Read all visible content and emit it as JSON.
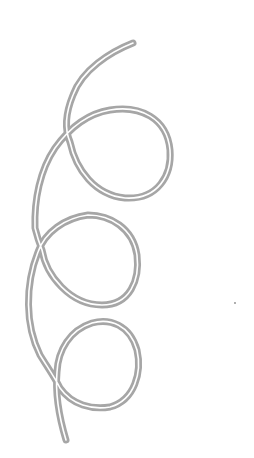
{
  "image": {
    "subject": "line drawing of a looping coiled ribbon with three loops",
    "background_color": "#ffffff",
    "stroke_color": "#a6a6a6",
    "gap_color": "#ffffff",
    "loops": 3
  }
}
